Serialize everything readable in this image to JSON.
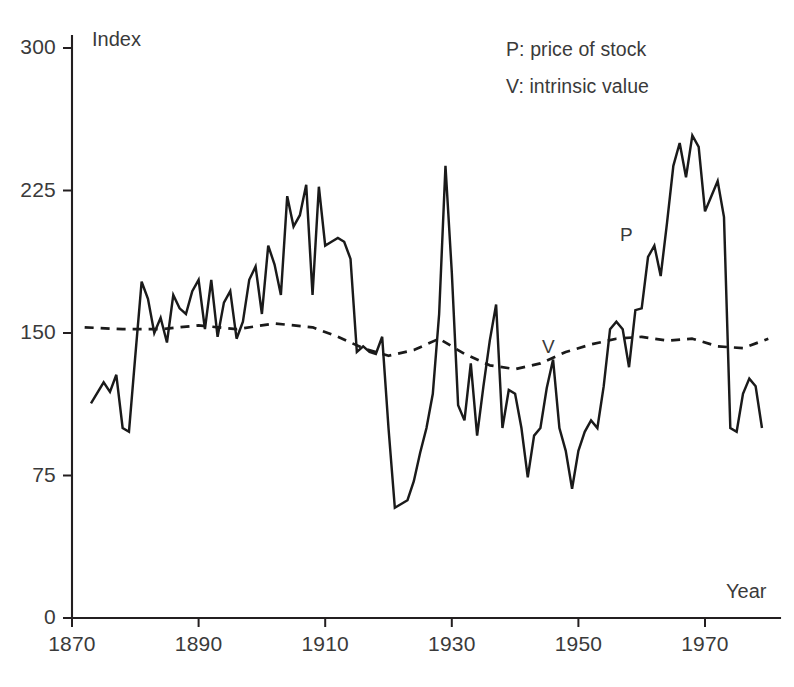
{
  "chart_data": {
    "type": "line",
    "title": "",
    "subtitle": "",
    "xlabel": "Year",
    "ylabel": "Index",
    "xlim": [
      1870,
      1981
    ],
    "ylim": [
      0,
      300
    ],
    "grid": false,
    "legend_position": "top-right",
    "x_ticks": [
      1870,
      1890,
      1910,
      1930,
      1950,
      1970
    ],
    "x_tick_labels": [
      "1870",
      "1890",
      "1910",
      "1930",
      "1950",
      "1970"
    ],
    "y_ticks": [
      0,
      75,
      150,
      225,
      300
    ],
    "y_tick_labels": [
      "0",
      "75",
      "150",
      "225",
      "300"
    ],
    "annotations": [
      {
        "text": "P",
        "x": 1957,
        "y": 205
      },
      {
        "text": "V",
        "x": 1945,
        "y": 146
      }
    ],
    "series": [
      {
        "name": "P: price of stock",
        "key": "price",
        "style": "solid",
        "x": [
          1873,
          1875,
          1876,
          1877,
          1878,
          1879,
          1880,
          1881,
          1882,
          1883,
          1884,
          1885,
          1886,
          1887,
          1888,
          1889,
          1890,
          1891,
          1892,
          1893,
          1894,
          1895,
          1896,
          1897,
          1898,
          1899,
          1900,
          1901,
          1902,
          1903,
          1904,
          1905,
          1906,
          1907,
          1908,
          1909,
          1910,
          1911,
          1912,
          1913,
          1914,
          1915,
          1916,
          1917,
          1918,
          1919,
          1920,
          1921,
          1922,
          1923,
          1924,
          1925,
          1926,
          1927,
          1928,
          1929,
          1930,
          1931,
          1932,
          1933,
          1934,
          1935,
          1936,
          1937,
          1938,
          1939,
          1940,
          1941,
          1942,
          1943,
          1944,
          1945,
          1946,
          1947,
          1948,
          1949,
          1950,
          1951,
          1952,
          1953,
          1954,
          1955,
          1956,
          1957,
          1958,
          1959,
          1960,
          1961,
          1962,
          1963,
          1964,
          1965,
          1966,
          1967,
          1968,
          1969,
          1970,
          1971,
          1972,
          1973,
          1974,
          1975,
          1976,
          1977,
          1978,
          1979
        ],
        "y": [
          113,
          124,
          119,
          128,
          100,
          98,
          138,
          177,
          168,
          150,
          158,
          145,
          170,
          163,
          160,
          172,
          178,
          152,
          178,
          148,
          166,
          172,
          147,
          156,
          178,
          185,
          160,
          196,
          186,
          170,
          222,
          206,
          212,
          228,
          170,
          227,
          196,
          198,
          200,
          198,
          189,
          140,
          143,
          140,
          139,
          148,
          100,
          58,
          60,
          62,
          72,
          87,
          100,
          118,
          160,
          238,
          182,
          112,
          104,
          134,
          96,
          122,
          146,
          165,
          100,
          120,
          118,
          100,
          74,
          96,
          100,
          121,
          136,
          100,
          88,
          68,
          88,
          98,
          104,
          100,
          122,
          152,
          156,
          152,
          132,
          162,
          163,
          190,
          196,
          180,
          208,
          238,
          250,
          232,
          254,
          248,
          214,
          222,
          230,
          211,
          100,
          98,
          118,
          126,
          122,
          100
        ]
      },
      {
        "name": "V: intrinsic value",
        "key": "value",
        "style": "dashed",
        "x": [
          1872,
          1878,
          1884,
          1890,
          1896,
          1902,
          1908,
          1912,
          1916,
          1920,
          1924,
          1928,
          1932,
          1936,
          1940,
          1944,
          1948,
          1952,
          1956,
          1960,
          1964,
          1968,
          1972,
          1976,
          1980
        ],
        "y": [
          153,
          152,
          152,
          154,
          152,
          155,
          153,
          148,
          142,
          138,
          141,
          147,
          139,
          133,
          131,
          134,
          140,
          144,
          147,
          148,
          146,
          147,
          143,
          142,
          147
        ]
      }
    ]
  },
  "legend": {
    "price_entry": "P: price of stock",
    "value_entry": "V: intrinsic value"
  },
  "labels": {
    "y_axis_title": "Index",
    "x_axis_title": "Year",
    "price_tag": "P",
    "value_tag": "V"
  },
  "colors": {
    "ink": "#231f20",
    "line": "#1a1a1a",
    "background": "#ffffff"
  }
}
